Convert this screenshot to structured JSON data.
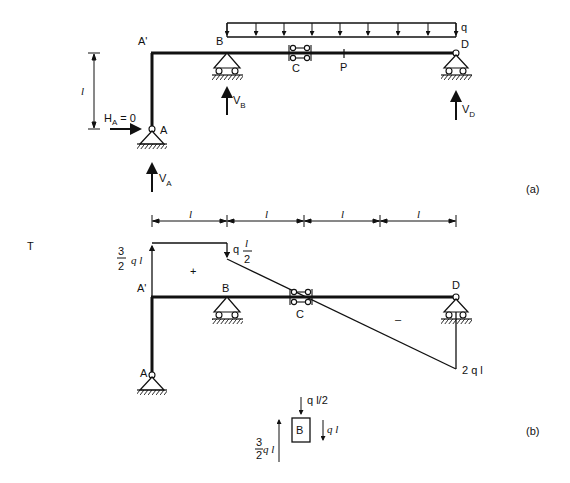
{
  "figure": {
    "part_a": {
      "label": "(a)",
      "nodes": {
        "A_prime": "A'",
        "A": "A",
        "B": "B",
        "C": "C",
        "P": "P",
        "D": "D"
      },
      "load": {
        "label": "q",
        "type": "uniformly distributed",
        "arrows": 9
      },
      "height_dim": "l",
      "reactions": {
        "HA": {
          "main": "H",
          "sub": "A",
          "suffix": " = 0"
        },
        "VA": {
          "main": "V",
          "sub": "A"
        },
        "VB": {
          "main": "V",
          "sub": "B"
        },
        "VD": {
          "main": "V",
          "sub": "D"
        }
      }
    },
    "part_b": {
      "label": "(b)",
      "diagram_title": "T",
      "nodes": {
        "A_prime": "A'",
        "A": "A",
        "B": "B",
        "C": "C",
        "D": "D"
      },
      "span_dims": [
        "l",
        "l",
        "l",
        "l"
      ],
      "shear_values": {
        "left": {
          "num": "3",
          "den": "2",
          "suffix": "q l"
        },
        "step": {
          "prefix": "q",
          "num": "l",
          "den": "2"
        },
        "right": "2 q l"
      },
      "signs": {
        "positive": "+",
        "negative": "–"
      },
      "free_body": {
        "node": "B",
        "top_load": "q  l/2",
        "right_force": "q l",
        "left_force": {
          "num": "3",
          "den": "2",
          "suffix": "q l"
        }
      }
    }
  }
}
